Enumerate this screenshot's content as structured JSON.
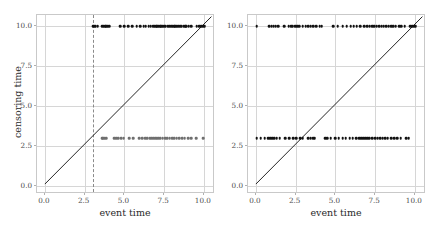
{
  "figure": {
    "width": 436,
    "height": 226,
    "background": "#ffffff",
    "point_color": "#111111",
    "line_color": "#222222",
    "grid_color": "#d6d6d6",
    "dashed_color": "#8a8a8a"
  },
  "chart_data": [
    {
      "type": "scatter",
      "title": "",
      "xlabel": "event time",
      "ylabel": "censoring time",
      "xlim": [
        -0.5,
        10.7
      ],
      "ylim": [
        -0.5,
        10.7
      ],
      "xticks": [
        0.0,
        2.5,
        5.0,
        7.5,
        10.0
      ],
      "xticklabels": [
        "0.0",
        "2.5",
        "5.0",
        "7.5",
        "10.0"
      ],
      "yticks": [
        0.0,
        2.5,
        5.0,
        7.5,
        10.0
      ],
      "yticklabels": [
        "0.0",
        "2.5",
        "5.0",
        "7.5",
        "10.0"
      ],
      "grid": true,
      "legend": null,
      "annotations": [
        {
          "kind": "vline",
          "x": 3.0,
          "style": "dashed",
          "color": "#8a8a8a"
        },
        {
          "kind": "identity-line",
          "from": [
            0.0,
            0.0
          ],
          "to": [
            10.6,
            10.6
          ],
          "style": "solid",
          "color": "#222222"
        }
      ],
      "series": [
        {
          "name": "censored at 10.0",
          "y_value": 10.0,
          "x": [
            3.02,
            3.12,
            3.2,
            3.33,
            3.62,
            3.7,
            3.78,
            3.86,
            3.95,
            4.03,
            4.72,
            4.98,
            5.25,
            5.5,
            5.78,
            6.0,
            6.22,
            6.35,
            6.52,
            6.66,
            6.8,
            6.9,
            7.0,
            7.08,
            7.16,
            7.24,
            7.3,
            7.42,
            7.5,
            7.6,
            7.72,
            7.82,
            7.95,
            8.05,
            8.12,
            8.2,
            8.3,
            8.4,
            8.5,
            8.6,
            8.72,
            8.82,
            8.9,
            9.05,
            9.2,
            9.55,
            9.7,
            9.85,
            9.95,
            10.05
          ]
        },
        {
          "name": "censored at 3.0",
          "y_value": 3.0,
          "x": [
            3.6,
            3.68,
            3.76,
            3.84,
            4.35,
            4.5,
            4.62,
            4.78,
            4.95,
            5.3,
            5.55,
            5.92,
            6.12,
            6.3,
            6.45,
            6.58,
            6.7,
            6.82,
            6.92,
            7.02,
            7.12,
            7.24,
            7.4,
            7.55,
            7.7,
            7.86,
            8.0,
            8.15,
            8.3,
            8.45,
            8.62,
            8.8,
            9.0,
            9.22,
            9.5,
            9.95
          ]
        }
      ]
    },
    {
      "type": "scatter",
      "title": "",
      "xlabel": "event time",
      "ylabel": "",
      "xlim": [
        -0.5,
        10.7
      ],
      "ylim": [
        -0.5,
        10.7
      ],
      "xticks": [
        0.0,
        2.5,
        5.0,
        7.5,
        10.0
      ],
      "xticklabels": [
        "0.0",
        "2.5",
        "5.0",
        "7.5",
        "10.0"
      ],
      "yticks": [
        0.0,
        2.5,
        5.0,
        7.5,
        10.0
      ],
      "yticklabels": [
        "0.0",
        "2.5",
        "5.0",
        "7.5",
        "10.0"
      ],
      "grid": true,
      "legend": null,
      "annotations": [
        {
          "kind": "identity-line",
          "from": [
            0.0,
            0.0
          ],
          "to": [
            10.6,
            10.6
          ],
          "style": "solid",
          "color": "#222222"
        }
      ],
      "series": [
        {
          "name": "censored at 10.0",
          "y_value": 10.0,
          "x": [
            0.05,
            0.85,
            1.0,
            1.12,
            1.25,
            1.4,
            1.78,
            2.05,
            2.2,
            2.32,
            2.48,
            2.6,
            2.72,
            2.95,
            3.12,
            3.3,
            3.45,
            3.62,
            3.8,
            4.0,
            4.15,
            4.85,
            5.15,
            5.45,
            5.7,
            5.95,
            6.15,
            6.35,
            6.55,
            6.8,
            7.0,
            7.15,
            7.3,
            7.45,
            7.6,
            7.75,
            7.9,
            8.05,
            8.2,
            8.35,
            8.5,
            8.65,
            8.8,
            9.0,
            9.15,
            9.35,
            9.7,
            9.85,
            9.95,
            10.05
          ]
        },
        {
          "name": "censored at 3.0",
          "y_value": 3.0,
          "x": [
            0.05,
            0.3,
            0.55,
            0.78,
            0.9,
            1.02,
            1.15,
            1.3,
            1.5,
            1.85,
            2.1,
            2.35,
            2.55,
            2.78,
            2.95,
            3.3,
            3.45,
            3.6,
            3.7,
            4.35,
            4.5,
            4.7,
            5.0,
            5.2,
            5.45,
            5.65,
            5.9,
            6.1,
            6.3,
            6.5,
            6.62,
            6.75,
            6.88,
            7.0,
            7.12,
            7.3,
            7.5,
            7.65,
            7.82,
            7.98,
            8.15,
            8.3,
            8.5,
            8.7,
            8.9,
            9.1,
            9.45,
            9.6
          ]
        }
      ]
    }
  ]
}
